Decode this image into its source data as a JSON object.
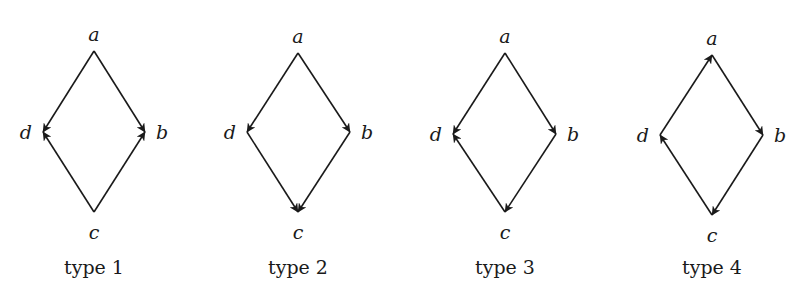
{
  "diagrams": [
    {
      "caption": "type 1",
      "nodes": {
        "a": {
          "label": "a",
          "x": 94,
          "y": 51
        },
        "b": {
          "label": "b",
          "x": 145,
          "y": 132
        },
        "c": {
          "label": "c",
          "x": 94,
          "y": 212
        },
        "d": {
          "label": "d",
          "x": 43,
          "y": 132
        }
      },
      "edges": [
        [
          "a",
          "d"
        ],
        [
          "a",
          "b"
        ],
        [
          "c",
          "d"
        ],
        [
          "c",
          "b"
        ]
      ]
    },
    {
      "caption": "type 2",
      "nodes": {
        "a": {
          "label": "a",
          "x": 298,
          "y": 53
        },
        "b": {
          "label": "b",
          "x": 350,
          "y": 132
        },
        "c": {
          "label": "c",
          "x": 298,
          "y": 212
        },
        "d": {
          "label": "d",
          "x": 247,
          "y": 132
        }
      },
      "edges": [
        [
          "a",
          "d"
        ],
        [
          "a",
          "b"
        ],
        [
          "d",
          "c"
        ],
        [
          "b",
          "c"
        ]
      ]
    },
    {
      "caption": "type 3",
      "nodes": {
        "a": {
          "label": "a",
          "x": 505,
          "y": 53
        },
        "b": {
          "label": "b",
          "x": 556,
          "y": 134
        },
        "c": {
          "label": "c",
          "x": 505,
          "y": 212
        },
        "d": {
          "label": "d",
          "x": 453,
          "y": 134
        }
      },
      "edges": [
        [
          "a",
          "d"
        ],
        [
          "a",
          "b"
        ],
        [
          "c",
          "d"
        ],
        [
          "b",
          "c"
        ]
      ]
    },
    {
      "caption": "type 4",
      "nodes": {
        "a": {
          "label": "a",
          "x": 712,
          "y": 55
        },
        "b": {
          "label": "b",
          "x": 763,
          "y": 135
        },
        "c": {
          "label": "c",
          "x": 712,
          "y": 215
        },
        "d": {
          "label": "d",
          "x": 660,
          "y": 135
        }
      },
      "edges": [
        [
          "d",
          "a"
        ],
        [
          "a",
          "b"
        ],
        [
          "b",
          "c"
        ],
        [
          "c",
          "d"
        ]
      ]
    }
  ],
  "colors": {
    "stroke": "#1a1a1a",
    "background": "#ffffff"
  }
}
